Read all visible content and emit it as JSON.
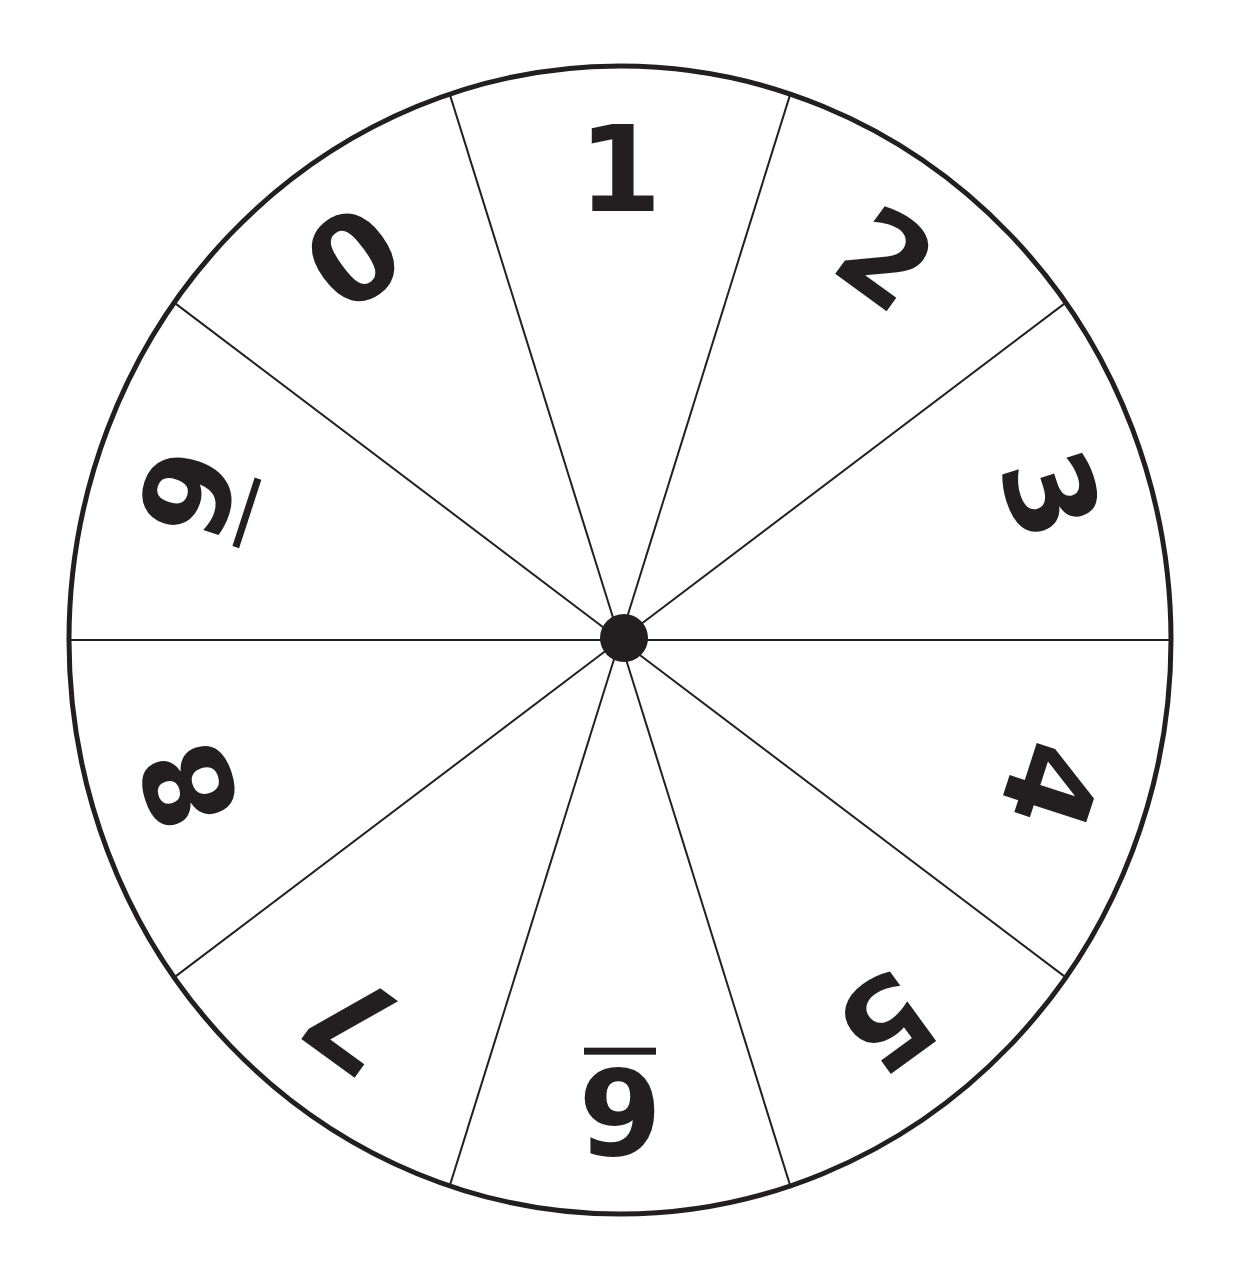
{
  "wheel": {
    "center": [
      620,
      640
    ],
    "rx": 551,
    "ry": 574,
    "stroke_color": "#231f20",
    "fill_color": "#ffffff",
    "sector_count": 10,
    "sectors": [
      {
        "label": "1",
        "angle": 0,
        "underline": false
      },
      {
        "label": "2",
        "angle": 36,
        "underline": false
      },
      {
        "label": "3",
        "angle": 72,
        "underline": false
      },
      {
        "label": "4",
        "angle": 108,
        "underline": false
      },
      {
        "label": "5",
        "angle": 144,
        "underline": false
      },
      {
        "label": "6",
        "angle": 180,
        "underline": true
      },
      {
        "label": "7",
        "angle": 216,
        "underline": false
      },
      {
        "label": "8",
        "angle": 252,
        "underline": false
      },
      {
        "label": "9",
        "angle": 288,
        "underline": true
      },
      {
        "label": "0",
        "angle": 324,
        "underline": false
      }
    ]
  }
}
